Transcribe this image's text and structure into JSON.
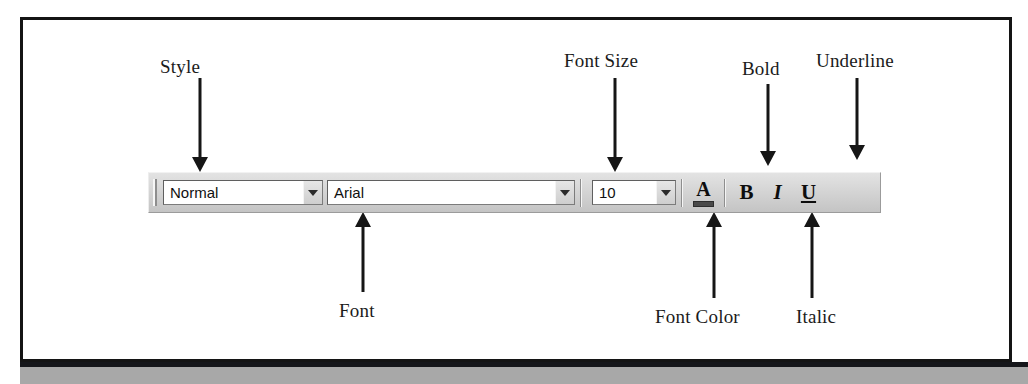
{
  "figure": {
    "kind": "annotated-toolbar-diagram",
    "border_color": "#141414",
    "page_band_color": "#a8a8a8"
  },
  "callouts": {
    "style": "Style",
    "font_size": "Font Size",
    "bold": "Bold",
    "underline": "Underline",
    "font": "Font",
    "font_color": "Font Color",
    "italic": "Italic"
  },
  "toolbar": {
    "grip": "drag-grip",
    "style_combo": {
      "value": "Normal",
      "dropdown_icon": "chevron-down-icon"
    },
    "font_combo": {
      "value": "Arial",
      "dropdown_icon": "chevron-down-icon"
    },
    "size_combo": {
      "value": "10",
      "dropdown_icon": "chevron-down-icon"
    },
    "font_color_button": {
      "glyph": "A",
      "swatch_color": "#4a4a4a"
    },
    "bold_button": {
      "glyph": "B"
    },
    "italic_button": {
      "glyph": "I"
    },
    "underline_button": {
      "glyph": "U"
    }
  }
}
